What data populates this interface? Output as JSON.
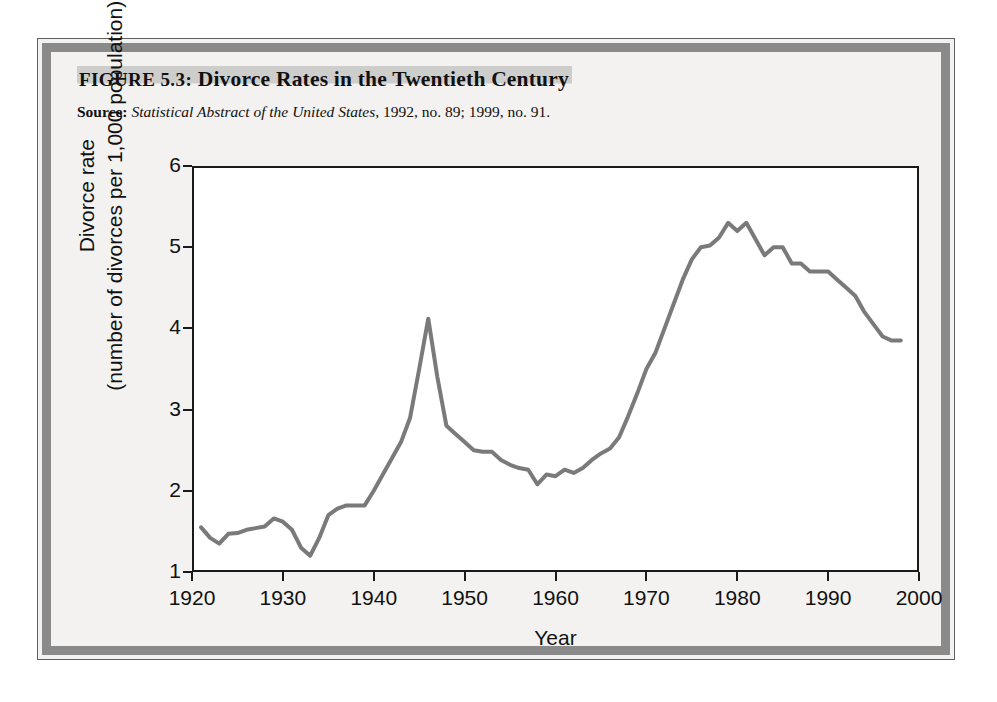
{
  "figure": {
    "title_lead": "FIGURE 5.3:",
    "title_main": "Divorce Rates in the Twentieth Century",
    "source_label": "Source:",
    "source_work": "Statistical Abstract of the United States,",
    "source_rest": "1992, no. 89; 1999, no. 91."
  },
  "chart_data": {
    "type": "line",
    "title": "Divorce Rates in the Twentieth Century",
    "xlabel": "Year",
    "ylabel_line1": "Divorce rate",
    "ylabel_line2": "(number of divorces per 1,000 population)",
    "xlim": [
      1920,
      2000
    ],
    "ylim": [
      1,
      6
    ],
    "xticks": [
      1920,
      1930,
      1940,
      1950,
      1960,
      1970,
      1980,
      1990,
      2000
    ],
    "yticks": [
      1,
      2,
      3,
      4,
      5,
      6
    ],
    "grid": false,
    "legend": "none",
    "line_color": "#7a7a7a",
    "line_width": 4,
    "series": [
      {
        "name": "Divorce rate",
        "x": [
          1921,
          1922,
          1923,
          1924,
          1925,
          1926,
          1927,
          1928,
          1929,
          1930,
          1931,
          1932,
          1933,
          1934,
          1935,
          1936,
          1937,
          1938,
          1939,
          1940,
          1941,
          1942,
          1943,
          1944,
          1945,
          1946,
          1947,
          1948,
          1949,
          1950,
          1951,
          1952,
          1953,
          1954,
          1955,
          1956,
          1957,
          1958,
          1959,
          1960,
          1961,
          1962,
          1963,
          1964,
          1965,
          1966,
          1967,
          1968,
          1969,
          1970,
          1971,
          1972,
          1973,
          1974,
          1975,
          1976,
          1977,
          1978,
          1979,
          1980,
          1981,
          1982,
          1983,
          1984,
          1985,
          1986,
          1987,
          1988,
          1989,
          1990,
          1991,
          1992,
          1993,
          1994,
          1995,
          1996,
          1997,
          1998
        ],
        "values": [
          1.55,
          1.42,
          1.35,
          1.47,
          1.48,
          1.52,
          1.54,
          1.56,
          1.66,
          1.62,
          1.52,
          1.3,
          1.2,
          1.42,
          1.7,
          1.78,
          1.82,
          1.82,
          1.82,
          2.0,
          2.2,
          2.4,
          2.6,
          2.9,
          3.5,
          4.12,
          3.4,
          2.8,
          2.7,
          2.6,
          2.5,
          2.48,
          2.48,
          2.38,
          2.32,
          2.28,
          2.26,
          2.08,
          2.2,
          2.18,
          2.26,
          2.22,
          2.28,
          2.38,
          2.46,
          2.52,
          2.66,
          2.92,
          3.2,
          3.5,
          3.7,
          4.0,
          4.3,
          4.6,
          4.85,
          5.0,
          5.02,
          5.12,
          5.3,
          5.2,
          5.3,
          5.1,
          4.9,
          5.0,
          5.0,
          4.8,
          4.8,
          4.7,
          4.7,
          4.7,
          4.6,
          4.5,
          4.4,
          4.2,
          4.05,
          3.9,
          3.85,
          3.85
        ]
      }
    ],
    "annotations": [
      {
        "label": "postwar spike",
        "x": 1946,
        "y": 4.12
      },
      {
        "label": "Depression low",
        "x": 1933,
        "y": 1.2
      },
      {
        "label": "modern peak",
        "x": 1979,
        "y": 5.0
      },
      {
        "label": "late-1950s trough",
        "x": 1958,
        "y": 1.95
      }
    ]
  }
}
